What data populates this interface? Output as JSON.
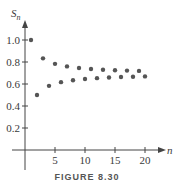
{
  "chart_data": {
    "type": "scatter",
    "title": "",
    "xlabel": "n",
    "ylabel": "S_n",
    "ylabel_display": {
      "base": "S",
      "sub": "n"
    },
    "x_ticks": [
      5,
      10,
      15,
      20
    ],
    "y_ticks": [
      0.2,
      0.4,
      0.6,
      0.8,
      1.0
    ],
    "y_tick_labels": [
      "0.2",
      "0.4",
      "0.6",
      "0.8",
      "1.0"
    ],
    "xlim": [
      0,
      21
    ],
    "ylim": [
      0,
      1.05
    ],
    "grid": false,
    "series": [
      {
        "name": "partial sums",
        "x": [
          1,
          2,
          3,
          4,
          5,
          6,
          7,
          8,
          9,
          10,
          11,
          12,
          13,
          14,
          15,
          16,
          17,
          18,
          19,
          20
        ],
        "values": [
          1.0,
          0.5,
          0.833,
          0.583,
          0.783,
          0.617,
          0.76,
          0.634,
          0.746,
          0.646,
          0.737,
          0.653,
          0.73,
          0.659,
          0.725,
          0.663,
          0.722,
          0.666,
          0.719,
          0.669
        ]
      }
    ],
    "color": "#555555"
  },
  "caption": "FIGURE 8.30"
}
